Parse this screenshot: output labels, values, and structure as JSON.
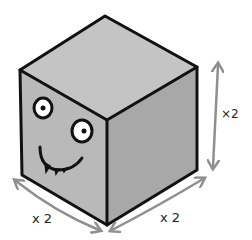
{
  "diagram": {
    "colors": {
      "top_face": "#c4c4c4",
      "left_face": "#b9b9b9",
      "right_face": "#a8a8a8",
      "outline": "#111111",
      "arrows": "#8f8f8f",
      "eye_white": "#ffffff"
    },
    "labels": {
      "left_edge": "x 2",
      "right_edge": "x 2",
      "height_edge": "×2"
    }
  }
}
